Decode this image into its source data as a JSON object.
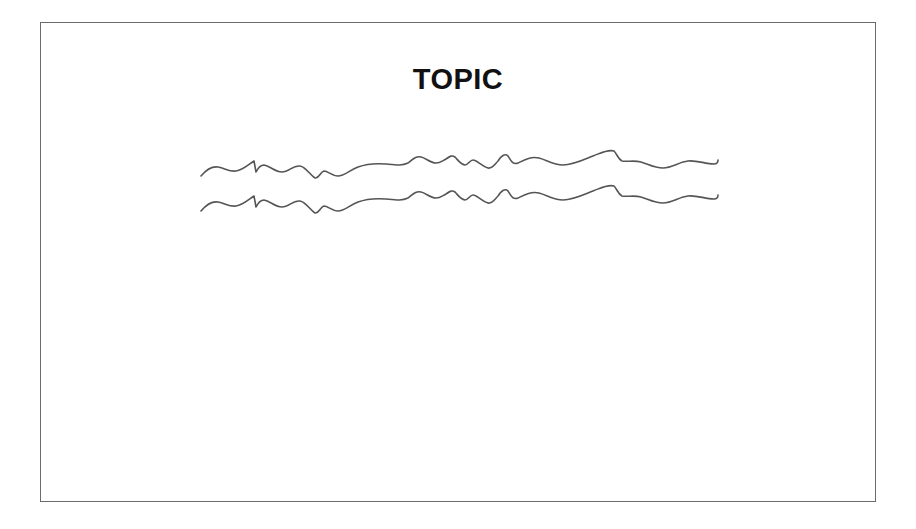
{
  "slide": {
    "title": "TOPIC",
    "body_placeholder": {
      "type": "scribbled-text-lines",
      "line_count": 2,
      "description": "Two identical wavy handwritten-style lines representing illegible/placeholder text"
    }
  },
  "colors": {
    "background": "#ffffff",
    "frame_border": "#6b6b6b",
    "title_text": "#111111",
    "scribble_stroke": "#555555"
  }
}
